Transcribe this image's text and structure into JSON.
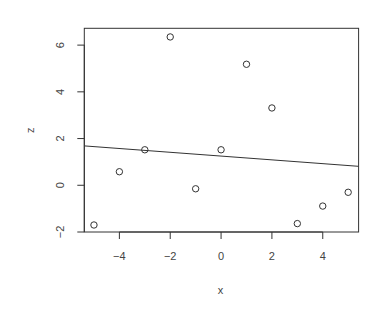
{
  "chart_data": {
    "type": "scatter",
    "title": "",
    "xlabel": "x",
    "ylabel": "z",
    "x": [
      -5,
      -4,
      -3,
      -2,
      -1,
      0,
      1,
      2,
      3,
      4,
      5
    ],
    "series": [
      {
        "name": "points",
        "marker": "open-circle",
        "values": [
          -1.7,
          0.58,
          1.52,
          6.35,
          -0.15,
          1.52,
          5.18,
          3.31,
          -1.64,
          -0.89,
          -0.3
        ]
      }
    ],
    "regression_line": {
      "intercept": 1.25,
      "slope": -0.081
    },
    "xlim": [
      -5.38,
      5.41
    ],
    "ylim": [
      -2.0,
      6.72
    ],
    "x_ticks": [
      -4,
      -2,
      0,
      2,
      4
    ],
    "x_tick_labels": [
      "−4",
      "−2",
      "0",
      "2",
      "4"
    ],
    "y_ticks": [
      -2,
      0,
      2,
      4,
      6
    ],
    "y_tick_labels": [
      "−2",
      "0",
      "2",
      "4",
      "6"
    ],
    "grid": false,
    "legend": "none",
    "colors": {
      "ink": "#333333",
      "text": "#444444"
    }
  }
}
